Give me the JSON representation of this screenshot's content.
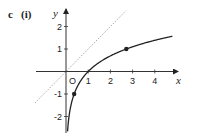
{
  "figure": {
    "part_label": "c",
    "sub_label": "(i)"
  },
  "chart_data": {
    "type": "line",
    "title": "",
    "xlabel": "x",
    "ylabel": "y",
    "origin_label": "O",
    "xlim": [
      -1.4,
      4.9
    ],
    "ylim": [
      -2.6,
      2.6
    ],
    "grid": false,
    "legend": null,
    "x_ticks": [
      1,
      2,
      3,
      4
    ],
    "x_tick_labels": [
      "1",
      "2",
      "3",
      "4"
    ],
    "y_ticks": [
      -2,
      -1,
      1,
      2
    ],
    "y_tick_labels": [
      "-2",
      "-1",
      "1",
      "2"
    ],
    "series": [
      {
        "name": "y = ln x",
        "style": "solid",
        "color": "#222222",
        "x": [
          0.07,
          0.1,
          0.2,
          0.3,
          0.368,
          0.5,
          0.75,
          1,
          1.5,
          2,
          2.718,
          3,
          3.5,
          4,
          4.5,
          4.8
        ],
        "y": [
          -2.66,
          -2.3,
          -1.61,
          -1.2,
          -1,
          -0.69,
          -0.29,
          0,
          0.41,
          0.69,
          1,
          1.1,
          1.25,
          1.39,
          1.5,
          1.57
        ]
      },
      {
        "name": "y = x",
        "style": "dotted",
        "color": "#aaaaaa",
        "x": [
          -1.4,
          2.7
        ],
        "y": [
          -1.4,
          2.7
        ]
      }
    ],
    "points": [
      {
        "x": 0.368,
        "y": -1,
        "label": ""
      },
      {
        "x": 2.718,
        "y": 1,
        "label": ""
      }
    ]
  }
}
